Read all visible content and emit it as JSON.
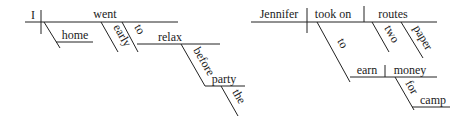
{
  "diagrams": [
    {
      "sentence_words": [
        "I",
        "went",
        "home",
        "early",
        "to",
        "relax",
        "before",
        "the",
        "party"
      ],
      "subject": "I",
      "verb": "went",
      "modifiers": {
        "home": "home",
        "early": "early",
        "infinitive_marker": "to",
        "infinitive_verb": "relax",
        "preposition": "before",
        "prep_object": "party",
        "article": "the"
      }
    },
    {
      "sentence_words": [
        "Jennifer",
        "took on",
        "two",
        "paper",
        "routes",
        "to",
        "earn",
        "money",
        "for",
        "camp"
      ],
      "subject": "Jennifer",
      "verb": "took on",
      "direct_object": "routes",
      "modifiers": {
        "adj1": "two",
        "adj2": "paper",
        "infinitive_marker": "to",
        "infinitive_verb": "earn",
        "infinitive_object": "money",
        "preposition": "for",
        "prep_object": "camp"
      }
    }
  ]
}
